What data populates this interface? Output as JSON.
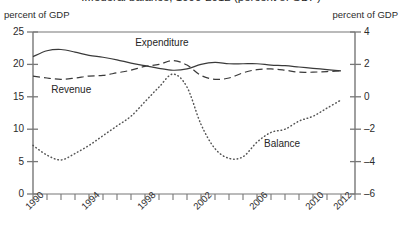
{
  "chart_data": {
    "type": "line",
    "title": "...federal balance, 1990-2012 (percent of GDP)",
    "xlabel": "",
    "ylabel": "percent of GDP",
    "ylabel_right": "percent of GDP",
    "grid": false,
    "legend_position": "inline-annotations",
    "x": [
      1990,
      1991,
      1992,
      1993,
      1994,
      1995,
      1996,
      1997,
      1998,
      1999,
      2000,
      2001,
      2002,
      2003,
      2004,
      2005,
      2006,
      2007,
      2008,
      2009,
      2010,
      2011,
      2012
    ],
    "xlim": [
      1990,
      2013
    ],
    "xticks_labeled": [
      "1990",
      "1994",
      "1998",
      "2002",
      "2006",
      "2010",
      "2012"
    ],
    "xticks_labeled_values": [
      1990,
      1994,
      1998,
      2002,
      2006,
      2010,
      2012
    ],
    "left_axis": {
      "ylim": [
        0,
        25
      ],
      "ticks": [
        0,
        5,
        10,
        15,
        20,
        25
      ],
      "label": "percent of GDP"
    },
    "right_axis": {
      "ylim": [
        -6,
        4
      ],
      "ticks": [
        4,
        2,
        0,
        -2,
        -4,
        -6
      ],
      "label": "percent of GDP"
    },
    "series": [
      {
        "name": "Expenditure",
        "axis": "left",
        "style": "solid",
        "color": "#3a3a3a",
        "values": [
          21.2,
          22.1,
          22.3,
          21.9,
          21.4,
          21.1,
          20.7,
          20.2,
          19.8,
          19.4,
          19.1,
          19.3,
          20.0,
          20.3,
          20.1,
          20.1,
          20.1,
          19.9,
          19.8,
          19.6,
          19.4,
          19.2,
          19.0
        ]
      },
      {
        "name": "Revenue",
        "axis": "left",
        "style": "dashed",
        "color": "#3a3a3a",
        "values": [
          18.2,
          17.9,
          17.7,
          17.9,
          18.2,
          18.3,
          18.7,
          19.1,
          19.7,
          20.0,
          20.6,
          19.9,
          18.3,
          17.7,
          17.9,
          18.7,
          19.2,
          19.3,
          19.1,
          18.8,
          18.8,
          18.9,
          19.0
        ]
      },
      {
        "name": "Balance",
        "axis": "right",
        "style": "dotted",
        "color": "#555555",
        "values": [
          -3.0,
          -3.6,
          -3.9,
          -3.5,
          -3.0,
          -2.4,
          -1.8,
          -1.2,
          -0.3,
          0.6,
          1.4,
          0.6,
          -1.7,
          -3.2,
          -3.8,
          -3.7,
          -2.8,
          -2.2,
          -2.0,
          -1.5,
          -1.2,
          -0.7,
          -0.2
        ]
      }
    ],
    "annotations": [
      {
        "text": "Expenditure",
        "x": 1997.3,
        "y_left": 23.2
      },
      {
        "text": "Revenue",
        "x": 1991.3,
        "y_left": 15.9
      },
      {
        "text": "Balance",
        "x": 2006.5,
        "y_right": -3.0
      }
    ]
  },
  "axis_labels": {
    "left_header": "percent of GDP",
    "right_header": "percent of GDP"
  },
  "title": "...federal balance, 1990-2012 (percent of GDP)"
}
